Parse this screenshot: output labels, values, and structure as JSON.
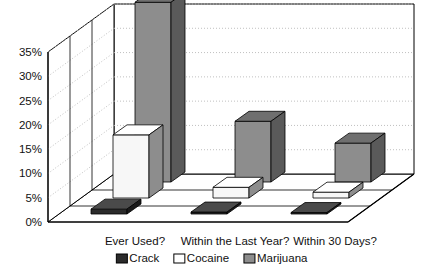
{
  "chart_data": {
    "type": "bar",
    "title": "",
    "subtitle": "",
    "xlabel": "",
    "ylabel": "",
    "categories": [
      "Ever Used?",
      "Within the Last Year?",
      "Within 30 Days?"
    ],
    "series": [
      {
        "name": "Crack",
        "color": "#2b2b2b",
        "values": [
          1.0,
          0.4,
          0.3
        ]
      },
      {
        "name": "Cocaine",
        "color": "#f7f7f7",
        "values": [
          13.0,
          2.2,
          1.2
        ]
      },
      {
        "name": "Marijuana",
        "color": "#8d8d8d",
        "values": [
          37.0,
          12.5,
          8.0
        ]
      }
    ],
    "ylim": [
      0,
      35
    ],
    "ytick_values": [
      0,
      5,
      10,
      15,
      20,
      25,
      30,
      35
    ],
    "ytick_labels": [
      "0%",
      "5%",
      "10%",
      "15%",
      "20%",
      "25%",
      "30%",
      "35%"
    ],
    "grid": true,
    "grid_style": "dotted",
    "legend_position": "bottom",
    "projection": "3d",
    "legend": [
      {
        "label": "Crack",
        "swatch": "#2b2b2b"
      },
      {
        "label": "Cocaine",
        "swatch": "#ffffff"
      },
      {
        "label": "Marijuana",
        "swatch": "#8d8d8d"
      }
    ]
  },
  "colors": {
    "axis": "#000000",
    "grid": "#b9b9b9",
    "wall": "#ffffff",
    "floor": "#ffffff",
    "text": "#111111",
    "crack": "#2b2b2b",
    "crack_top": "#4a4a4a",
    "crack_side": "#1a1a1a",
    "cocaine": "#f7f7f7",
    "cocaine_top": "#ffffff",
    "cocaine_side": "#8d8d8d",
    "marijuana": "#8d8d8d",
    "marijuana_top": "#6f6f6f",
    "marijuana_side": "#5a5a5a"
  }
}
